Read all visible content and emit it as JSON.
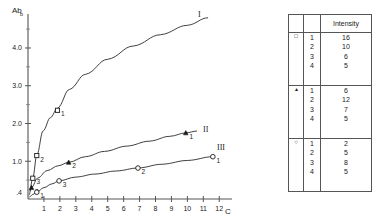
{
  "chart_data": {
    "type": "line",
    "title": "",
    "xlabel": "C",
    "ylabel": "Ab",
    "xlim": [
      0,
      12.8
    ],
    "ylim": [
      0,
      4.9
    ],
    "grid": false,
    "legend_position": "inline-curve-labels",
    "xticks": [
      1,
      2,
      3,
      4,
      5,
      6,
      7,
      8,
      9,
      10,
      11,
      12
    ],
    "xticklabels": [
      "1",
      "2",
      "3",
      "4",
      "5",
      "6",
      "7",
      "8",
      "9",
      "10",
      "11",
      "12"
    ],
    "yticks": [
      1.0,
      2.0,
      3.0,
      4.0
    ],
    "yticklabels": [
      "1.0",
      "2.0",
      "3.0",
      "4.0"
    ],
    "y_origin_label": ".4",
    "yminorticks": [
      0.5,
      1.5,
      2.5,
      3.5,
      4.5
    ],
    "series": [
      {
        "name": "I",
        "marker": "open-square",
        "label": "I",
        "points": [
          {
            "x": 0.3,
            "y": 0.55,
            "label": "3"
          },
          {
            "x": 0.55,
            "y": 1.15,
            "label": "2"
          },
          {
            "x": 1.85,
            "y": 2.35,
            "label": "1"
          }
        ],
        "x": [
          0.1,
          0.3,
          0.55,
          0.95,
          1.4,
          1.85,
          2.6,
          3.6,
          5.0,
          6.6,
          8.3,
          10.0,
          11.3
        ],
        "y": [
          0.22,
          0.55,
          1.15,
          1.8,
          2.15,
          2.4,
          2.9,
          3.3,
          3.7,
          4.05,
          4.35,
          4.6,
          4.8
        ]
      },
      {
        "name": "II",
        "marker": "filled-triangle",
        "label": "II",
        "points": [
          {
            "x": 0.22,
            "y": 0.3,
            "label": "3"
          },
          {
            "x": 2.55,
            "y": 0.97,
            "label": "2"
          },
          {
            "x": 9.9,
            "y": 1.75,
            "label": "1"
          }
        ],
        "x": [
          0.05,
          0.22,
          0.6,
          1.2,
          1.9,
          2.55,
          3.6,
          4.8,
          6.2,
          7.6,
          8.9,
          9.9,
          10.6
        ],
        "y": [
          0.1,
          0.3,
          0.55,
          0.75,
          0.88,
          0.97,
          1.12,
          1.26,
          1.4,
          1.53,
          1.66,
          1.75,
          1.8
        ]
      },
      {
        "name": "III",
        "marker": "open-circle",
        "label": "III",
        "points": [
          {
            "x": 0.55,
            "y": 0.18,
            "label": "1"
          },
          {
            "x": 1.95,
            "y": 0.48,
            "label": "3"
          },
          {
            "x": 6.9,
            "y": 0.82,
            "label": "2"
          },
          {
            "x": 11.6,
            "y": 1.12,
            "label": "1"
          }
        ],
        "x": [
          0.08,
          0.3,
          0.55,
          1.0,
          1.5,
          1.95,
          3.0,
          4.2,
          5.5,
          6.9,
          8.4,
          10.0,
          11.6
        ],
        "y": [
          0.05,
          0.12,
          0.18,
          0.3,
          0.4,
          0.48,
          0.58,
          0.66,
          0.74,
          0.82,
          0.92,
          1.02,
          1.12
        ]
      }
    ]
  },
  "table": {
    "header": {
      "sym": "",
      "idx": "",
      "intensity": "Intensity"
    },
    "groups": [
      {
        "symbol": "open-square",
        "symbol_glyph": "□",
        "indices": [
          "1",
          "2",
          "3",
          "4"
        ],
        "values": [
          "16",
          "10",
          "6",
          "5"
        ]
      },
      {
        "symbol": "filled-triangle",
        "symbol_glyph": "▴",
        "indices": [
          "1",
          "2",
          "3",
          "4"
        ],
        "values": [
          "6",
          "12",
          "7",
          "5"
        ]
      },
      {
        "symbol": "open-circle",
        "symbol_glyph": "○",
        "indices": [
          "1",
          "2",
          "3",
          "4"
        ],
        "values": [
          "2",
          "5",
          "8",
          "5"
        ]
      }
    ]
  },
  "colors": {
    "ink": "#1a1a1a",
    "axis": "#555555",
    "background": "#ffffff"
  }
}
